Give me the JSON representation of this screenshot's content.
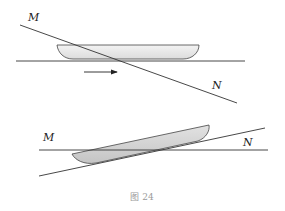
{
  "figure": {
    "caption": "图 24",
    "colors": {
      "line": "#333333",
      "boat_fill_top": "#e9e9e9",
      "boat_fill_bottom": "#cfcfcf",
      "caption": "#9a9a9a"
    },
    "top_diagram": {
      "label_m": "M",
      "label_n": "N",
      "elements": [
        "slanted line MN",
        "horizontal water surface line",
        "boat (flat)",
        "motion arrow pointing right"
      ]
    },
    "bottom_diagram": {
      "label_m": "M",
      "label_n": "N",
      "elements": [
        "horizontal line",
        "slanted line",
        "boat (tilted along slanted line)"
      ]
    }
  }
}
